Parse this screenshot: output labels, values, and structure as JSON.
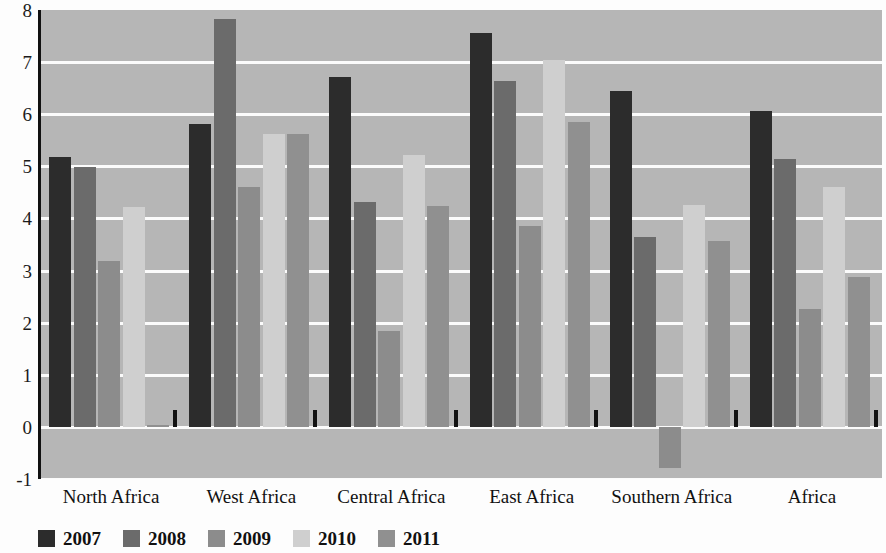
{
  "chart_data": {
    "type": "bar",
    "title": "",
    "subtitle": "",
    "xlabel": "",
    "ylabel": "",
    "ylim": [
      -1,
      8
    ],
    "ytick_labels": [
      "8",
      "7",
      "6",
      "5",
      "4",
      "3",
      "2",
      "1",
      "0",
      "-1"
    ],
    "yticks": [
      8,
      7,
      6,
      5,
      4,
      3,
      2,
      1,
      0,
      -1
    ],
    "grid": true,
    "legend_position": "bottom-left",
    "categories": [
      "North Africa",
      "West Africa",
      "Central Africa",
      "East Africa",
      "Southern Africa",
      "Africa"
    ],
    "series": [
      {
        "name": "2007",
        "color": "#2c2c2c",
        "values": [
          5.18,
          5.82,
          6.72,
          7.55,
          6.45,
          6.06
        ]
      },
      {
        "name": "2008",
        "color": "#6b6b6b",
        "values": [
          4.98,
          7.82,
          4.32,
          6.64,
          3.65,
          5.15
        ]
      },
      {
        "name": "2009",
        "color": "#8c8c8c",
        "values": [
          3.18,
          4.6,
          1.84,
          3.85,
          -0.78,
          2.26
        ]
      },
      {
        "name": "2010",
        "color": "#cfcfcf",
        "values": [
          4.22,
          5.62,
          5.22,
          7.05,
          4.25,
          4.6
        ]
      },
      {
        "name": "2011",
        "color": "#909090",
        "values": [
          0.03,
          5.62,
          4.24,
          5.86,
          3.56,
          2.88
        ]
      }
    ]
  },
  "legend": {
    "items": [
      {
        "label": "2007",
        "color": "#2c2c2c"
      },
      {
        "label": "2008",
        "color": "#6b6b6b"
      },
      {
        "label": "2009",
        "color": "#8c8c8c"
      },
      {
        "label": "2010",
        "color": "#cfcfcf"
      },
      {
        "label": "2011",
        "color": "#909090"
      }
    ]
  },
  "colors": {
    "plot_background": "#b6b6b6",
    "gridline": "#fbfbfb",
    "axis": "#111111",
    "page_background": "#fdfdfd",
    "text": "#111111"
  }
}
